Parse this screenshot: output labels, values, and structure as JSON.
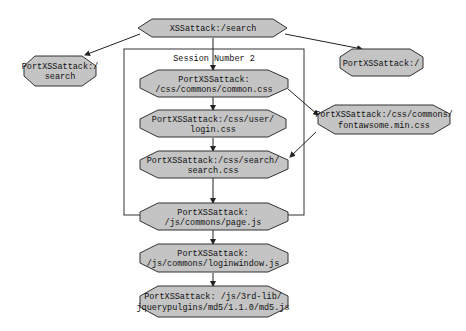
{
  "diagram": {
    "root": {
      "label": [
        "XSSattack:/search"
      ]
    },
    "session": {
      "label": "Session  Number 2"
    },
    "nodes": {
      "left": {
        "label": [
          "PortXSSattack:/",
          "search"
        ]
      },
      "right": {
        "label": [
          "PortXSSattack:/"
        ]
      },
      "common": {
        "label": [
          "PortXSSattack:",
          "/css/commons/common.css"
        ]
      },
      "login": {
        "label": [
          "PortXSSattack:/css/user/",
          "login.css"
        ]
      },
      "search": {
        "label": [
          "PortXSSattack:/css/search/",
          "search.css"
        ]
      },
      "fontawesome": {
        "label": [
          "PortXSSattack:/css/commons/",
          "fontawsome.min.css"
        ]
      },
      "page": {
        "label": [
          "PortXSSattack:",
          "/js/commons/page.js"
        ]
      },
      "loginwindow": {
        "label": [
          "PortXSSattack:",
          "/js/commons/loginwindow.js"
        ]
      },
      "md5": {
        "label": [
          "PortXSSattack: /js/3rd-lib/",
          "jquerypulgins/md5/1.1.0/md5.js"
        ]
      }
    },
    "colors": {
      "node_fill": "#c4c4c4",
      "stroke": "#222222"
    }
  }
}
